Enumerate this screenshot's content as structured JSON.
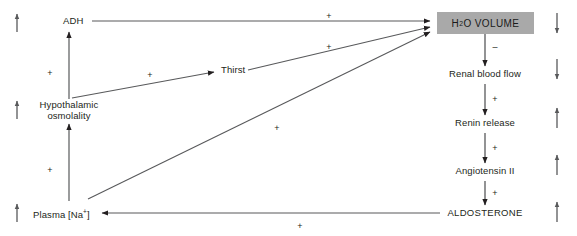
{
  "diagram": {
    "background_color": "#ffffff",
    "line_color": "#58595b",
    "text_color": "#231f20",
    "box_fill_color": "#a9a9a9",
    "nodes": [
      {
        "id": "adh",
        "label": "ADH",
        "x": 63,
        "y": 22,
        "align": "left"
      },
      {
        "id": "thirst",
        "label": "Thirst",
        "x": 221,
        "y": 71,
        "align": "left"
      },
      {
        "id": "hypothalamic",
        "label": "Hypothalamic",
        "x": 68,
        "y": 105,
        "align": "center"
      },
      {
        "id": "osmolality",
        "label": "osmolality",
        "x": 68,
        "y": 116,
        "align": "center"
      },
      {
        "id": "plasma_na",
        "label": "Plasma [Na",
        "sup": "+",
        "suffix": "]",
        "x": 33,
        "y": 208,
        "align": "left"
      },
      {
        "id": "h2o_volume",
        "label": "H",
        "sub": "2",
        "suffix2": "O VOLUME",
        "x": 437,
        "y": 12,
        "w": 97,
        "h": 22
      },
      {
        "id": "renal_blood",
        "label": "Renal blood flow",
        "x": 485,
        "y": 73,
        "align": "center"
      },
      {
        "id": "renin_release",
        "label": "Renin release",
        "x": 485,
        "y": 122,
        "align": "center"
      },
      {
        "id": "angiotensin_ii",
        "label": "Angiotensin II",
        "x": 485,
        "y": 170,
        "align": "center"
      },
      {
        "id": "aldosterone",
        "label": "ALDOSTERONE",
        "x": 485,
        "y": 212,
        "align": "center"
      }
    ],
    "signs": [
      {
        "id": "sign-hypothal-adh",
        "text": "+",
        "x": 50,
        "y": 73
      },
      {
        "id": "sign-hypothal-thirst",
        "text": "+",
        "x": 150,
        "y": 75
      },
      {
        "id": "sign-na-hypothal",
        "text": "+",
        "x": 50,
        "y": 170
      },
      {
        "id": "sign-adh-h2o",
        "text": "+",
        "x": 329,
        "y": 19
      },
      {
        "id": "sign-thirst-h2o",
        "text": "+",
        "x": 329,
        "y": 48
      },
      {
        "id": "sign-na-h2o",
        "text": "+",
        "x": 277,
        "y": 127
      },
      {
        "id": "sign-h2o-renal",
        "text": "–",
        "x": 494,
        "y": 46
      },
      {
        "id": "sign-renal-renin",
        "text": "+",
        "x": 494,
        "y": 98
      },
      {
        "id": "sign-renin-angio",
        "text": "+",
        "x": 494,
        "y": 147
      },
      {
        "id": "sign-angio-aldo",
        "text": "+",
        "x": 494,
        "y": 192
      },
      {
        "id": "sign-aldo-plasma",
        "text": "+",
        "x": 300,
        "y": 225
      }
    ],
    "flow_arrows": [
      {
        "id": "hypothalamic-to-adh",
        "from": "Hypothalamic osmolality",
        "to": "ADH",
        "sign": "+"
      },
      {
        "id": "hypothalamic-to-thirst",
        "from": "Hypothalamic osmolality",
        "to": "Thirst",
        "sign": "+"
      },
      {
        "id": "plasma-na-to-hypothalamic",
        "from": "Plasma [Na+]",
        "to": "Hypothalamic osmolality",
        "sign": "+"
      },
      {
        "id": "adh-to-h2o-volume",
        "from": "ADH",
        "to": "H2O VOLUME",
        "sign": "+"
      },
      {
        "id": "thirst-to-h2o-volume",
        "from": "Thirst",
        "to": "H2O VOLUME",
        "sign": "+"
      },
      {
        "id": "plasma-na-to-h2o-volume",
        "from": "Plasma [Na+]",
        "to": "H2O VOLUME",
        "sign": "+"
      },
      {
        "id": "h2o-volume-to-renal-blood",
        "from": "H2O VOLUME",
        "to": "Renal blood flow",
        "sign": "–"
      },
      {
        "id": "renal-blood-to-renin",
        "from": "Renal blood flow",
        "to": "Renin release",
        "sign": "+"
      },
      {
        "id": "renin-to-angiotensin",
        "from": "Renin release",
        "to": "Angiotensin II",
        "sign": "+"
      },
      {
        "id": "angiotensin-to-aldosterone",
        "from": "Angiotensin II",
        "to": "ALDOSTERONE",
        "sign": "+"
      },
      {
        "id": "aldosterone-to-plasma-na",
        "from": "ALDOSTERONE",
        "to": "Plasma [Na+]",
        "sign": "+"
      }
    ],
    "trend_indicators": {
      "left_column": [
        {
          "id": "trend-adh",
          "direction": "up",
          "for": "ADH",
          "x": 16,
          "y": 10
        },
        {
          "id": "trend-osmolality",
          "direction": "up",
          "for": "Hypothalamic osmolality",
          "x": 16,
          "y": 95
        },
        {
          "id": "trend-plasma-na",
          "direction": "up",
          "for": "Plasma [Na+]",
          "x": 16,
          "y": 196
        }
      ],
      "right_column": [
        {
          "id": "trend-h2o-volume",
          "direction": "down",
          "for": "H2O VOLUME",
          "x": 556,
          "y": 12
        },
        {
          "id": "trend-renal-blood",
          "direction": "down",
          "for": "Renal blood flow",
          "x": 556,
          "y": 58
        },
        {
          "id": "trend-renin",
          "direction": "up",
          "for": "Renin release",
          "x": 556,
          "y": 106
        },
        {
          "id": "trend-angiotensin",
          "direction": "up",
          "for": "Angiotensin II",
          "x": 556,
          "y": 152
        },
        {
          "id": "trend-aldosterone",
          "direction": "up",
          "for": "ALDOSTERONE",
          "x": 556,
          "y": 198
        }
      ]
    }
  }
}
